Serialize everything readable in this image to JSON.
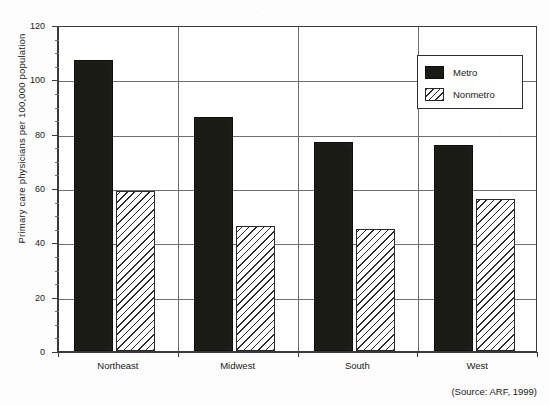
{
  "chart_data": {
    "type": "bar",
    "title": "",
    "subtitle": "",
    "xlabel": "",
    "ylabel": "Primary care physicians per 100,000 population",
    "categories": [
      "Northeast",
      "Midwest",
      "South",
      "West"
    ],
    "series": [
      {
        "name": "Metro",
        "values": [
          107,
          86,
          77,
          76
        ],
        "fill": "solid-black",
        "color": "#1b1b16"
      },
      {
        "name": "Nonmetro",
        "values": [
          59,
          46,
          45,
          56
        ],
        "fill": "diagonal-hatch",
        "color": "#ffffff"
      }
    ],
    "ylim": [
      0,
      120
    ],
    "yticks": [
      0,
      20,
      40,
      60,
      80,
      100,
      120
    ],
    "ytick_labels": [
      "0",
      "20",
      "40",
      "60",
      "80",
      "100",
      "120"
    ],
    "y_minor_tick_step": 5,
    "grid": "horizontal-gridlines-and-category-separators",
    "legend_position": "top-right-inside",
    "annotations": [
      "(Source: ARF, 1999)"
    ]
  },
  "legend": {
    "items": [
      {
        "label": "Metro",
        "swatch": "solid-black-swatch"
      },
      {
        "label": "Nonmetro",
        "swatch": "diagonal-hatch-swatch"
      }
    ]
  },
  "axis": {
    "y_title": "Primary care physicians per 100,000 population",
    "y_ticks": [
      "120",
      "100",
      "80",
      "60",
      "40",
      "20",
      "0"
    ],
    "x_categories": [
      "Northeast",
      "Midwest",
      "South",
      "West"
    ]
  },
  "footer": {
    "source": "(Source: ARF, 1999)"
  }
}
